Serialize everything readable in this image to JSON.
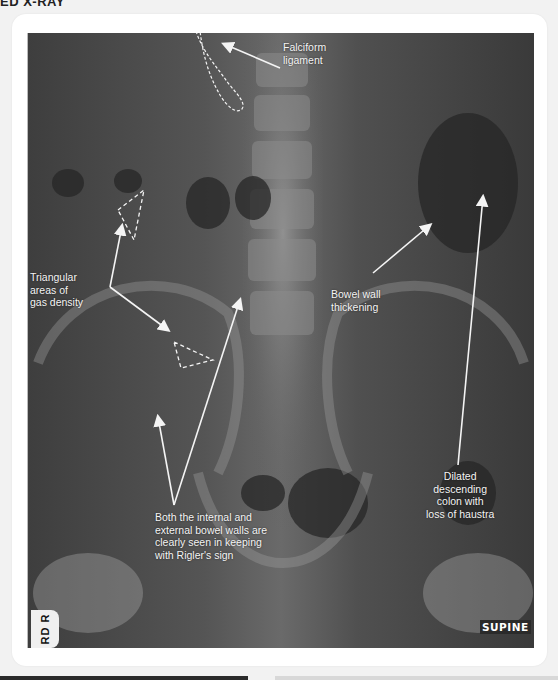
{
  "page": {
    "heading_fragment": "ED X-RAY"
  },
  "image": {
    "view_marker": "SUPINE",
    "side_marker": "RD R",
    "annotations": [
      {
        "id": "falciform",
        "lines": [
          "Falciform",
          "ligament"
        ]
      },
      {
        "id": "triangular",
        "lines": [
          "Triangular",
          "areas of",
          "gas density"
        ]
      },
      {
        "id": "bowel-wall",
        "lines": [
          "Bowel wall",
          "thickening"
        ]
      },
      {
        "id": "dilated-colon",
        "lines": [
          "Dilated",
          "descending",
          "colon with",
          "loss of haustra"
        ]
      },
      {
        "id": "rigler",
        "lines": [
          "Both the internal and",
          "external  bowel walls are",
          "clearly seen in keeping",
          "with Rigler's sign"
        ]
      }
    ]
  },
  "colors": {
    "annotation": "#f4f4f4",
    "card": "#ffffff",
    "page_bg": "#f2f2f2"
  }
}
